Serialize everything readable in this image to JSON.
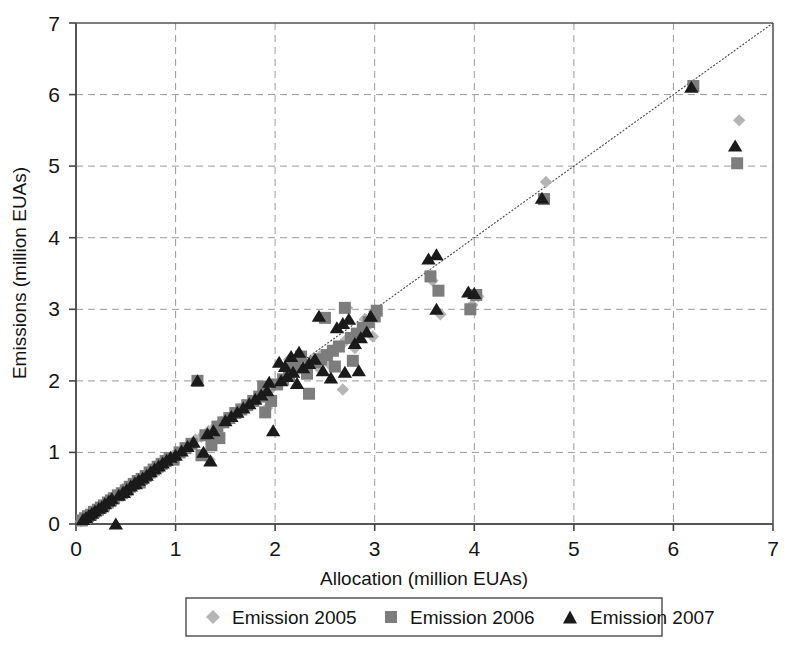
{
  "chart_data": {
    "type": "scatter",
    "title": "",
    "xlabel": "Allocation (million EUAs)",
    "ylabel": "Emissions (million EUAs)",
    "xlim": [
      0,
      7
    ],
    "ylim": [
      0,
      7
    ],
    "xticks": [
      "0",
      "1",
      "2",
      "3",
      "4",
      "5",
      "6",
      "7"
    ],
    "yticks": [
      "0",
      "1",
      "2",
      "3",
      "4",
      "5",
      "6",
      "7"
    ],
    "grid": "dashed-gray-both-axes",
    "legend_position": "below-axis-centered",
    "reference_line": {
      "label": "1:1 diagonal",
      "from": [
        0,
        0
      ],
      "to": [
        7,
        7
      ],
      "style": "thin dotted dark gray"
    },
    "legend": [
      {
        "label": "Emission 2005",
        "marker": "diamond",
        "color": "#b5b5b5"
      },
      {
        "label": "Emission 2006",
        "marker": "square",
        "color": "#7d7d7d"
      },
      {
        "label": "Emission 2007",
        "marker": "triangle",
        "color": "#1a1a1a"
      }
    ],
    "series": [
      {
        "name": "Emission 2005",
        "marker": "diamond",
        "color": "#b5b5b5",
        "points": [
          [
            0.05,
            0.04
          ],
          [
            0.08,
            0.07
          ],
          [
            0.11,
            0.1
          ],
          [
            0.14,
            0.12
          ],
          [
            0.17,
            0.16
          ],
          [
            0.2,
            0.19
          ],
          [
            0.23,
            0.21
          ],
          [
            0.26,
            0.25
          ],
          [
            0.3,
            0.28
          ],
          [
            0.33,
            0.31
          ],
          [
            0.36,
            0.34
          ],
          [
            0.4,
            0.38
          ],
          [
            0.44,
            0.41
          ],
          [
            0.48,
            0.45
          ],
          [
            0.52,
            0.5
          ],
          [
            0.56,
            0.54
          ],
          [
            0.6,
            0.57
          ],
          [
            0.64,
            0.62
          ],
          [
            0.68,
            0.66
          ],
          [
            0.72,
            0.69
          ],
          [
            0.76,
            0.74
          ],
          [
            0.8,
            0.78
          ],
          [
            0.84,
            0.82
          ],
          [
            0.88,
            0.86
          ],
          [
            0.7,
            0.62
          ],
          [
            0.75,
            0.68
          ],
          [
            0.92,
            0.9
          ],
          [
            0.97,
            0.95
          ],
          [
            1.02,
            1.0
          ],
          [
            1.08,
            1.05
          ],
          [
            1.14,
            1.1
          ],
          [
            1.2,
            1.18
          ],
          [
            1.26,
            1.22
          ],
          [
            1.33,
            1.3
          ],
          [
            1.4,
            1.36
          ],
          [
            1.46,
            1.42
          ],
          [
            1.52,
            1.48
          ],
          [
            1.58,
            1.53
          ],
          [
            1.64,
            1.6
          ],
          [
            1.7,
            1.66
          ],
          [
            1.76,
            1.72
          ],
          [
            1.83,
            1.78
          ],
          [
            1.9,
            1.85
          ],
          [
            1.97,
            1.9
          ],
          [
            2.04,
            1.97
          ],
          [
            2.1,
            2.02
          ],
          [
            2.17,
            2.1
          ],
          [
            2.24,
            2.16
          ],
          [
            2.3,
            2.22
          ],
          [
            2.38,
            2.3
          ],
          [
            2.46,
            2.36
          ],
          [
            2.54,
            2.24
          ],
          [
            2.62,
            2.48
          ],
          [
            2.7,
            2.55
          ],
          [
            2.26,
            2.18
          ],
          [
            2.72,
            2.58
          ],
          [
            2.78,
            2.62
          ],
          [
            2.86,
            2.7
          ],
          [
            2.94,
            2.78
          ],
          [
            2.66,
            2.5
          ],
          [
            2.68,
            1.88
          ],
          [
            2.8,
            2.46
          ],
          [
            2.72,
            3.02
          ],
          [
            2.9,
            2.86
          ],
          [
            3.58,
            3.4
          ],
          [
            3.66,
            2.93
          ],
          [
            3.98,
            3.06
          ],
          [
            4.04,
            3.18
          ],
          [
            4.72,
            4.78
          ],
          [
            6.66,
            5.64
          ],
          [
            1.34,
            0.9
          ],
          [
            1.92,
            1.62
          ],
          [
            2.14,
            2.3
          ],
          [
            2.44,
            2.18
          ],
          [
            2.56,
            2.42
          ],
          [
            2.98,
            2.62
          ],
          [
            0.45,
            0.42
          ],
          [
            0.58,
            0.52
          ]
        ]
      },
      {
        "name": "Emission 2006",
        "marker": "square",
        "color": "#7d7d7d",
        "points": [
          [
            0.06,
            0.05
          ],
          [
            0.09,
            0.08
          ],
          [
            0.12,
            0.11
          ],
          [
            0.15,
            0.13
          ],
          [
            0.18,
            0.17
          ],
          [
            0.22,
            0.2
          ],
          [
            0.25,
            0.23
          ],
          [
            0.28,
            0.26
          ],
          [
            0.32,
            0.3
          ],
          [
            0.35,
            0.33
          ],
          [
            0.38,
            0.36
          ],
          [
            0.42,
            0.4
          ],
          [
            0.46,
            0.43
          ],
          [
            0.5,
            0.47
          ],
          [
            0.54,
            0.52
          ],
          [
            0.58,
            0.56
          ],
          [
            0.62,
            0.6
          ],
          [
            0.66,
            0.63
          ],
          [
            0.7,
            0.67
          ],
          [
            0.74,
            0.72
          ],
          [
            0.78,
            0.76
          ],
          [
            0.82,
            0.8
          ],
          [
            0.86,
            0.84
          ],
          [
            0.9,
            0.88
          ],
          [
            0.94,
            0.92
          ],
          [
            0.98,
            0.9
          ],
          [
            1.04,
            1.0
          ],
          [
            1.1,
            1.06
          ],
          [
            1.16,
            1.12
          ],
          [
            1.22,
            2.0
          ],
          [
            1.3,
            1.24
          ],
          [
            1.36,
            1.1
          ],
          [
            1.42,
            1.36
          ],
          [
            1.48,
            1.42
          ],
          [
            1.54,
            1.48
          ],
          [
            1.6,
            1.55
          ],
          [
            1.66,
            1.6
          ],
          [
            1.72,
            1.66
          ],
          [
            1.78,
            1.72
          ],
          [
            1.84,
            1.78
          ],
          [
            1.9,
            1.56
          ],
          [
            1.96,
            1.72
          ],
          [
            2.02,
            1.95
          ],
          [
            2.08,
            2.02
          ],
          [
            2.14,
            2.08
          ],
          [
            2.2,
            2.28
          ],
          [
            2.26,
            2.34
          ],
          [
            2.32,
            2.1
          ],
          [
            2.4,
            2.26
          ],
          [
            2.46,
            2.3
          ],
          [
            2.52,
            2.36
          ],
          [
            2.58,
            2.42
          ],
          [
            2.64,
            2.48
          ],
          [
            2.7,
            3.02
          ],
          [
            2.76,
            2.6
          ],
          [
            2.82,
            2.66
          ],
          [
            2.88,
            2.74
          ],
          [
            2.94,
            2.82
          ],
          [
            3.0,
            2.9
          ],
          [
            2.6,
            2.2
          ],
          [
            3.56,
            3.46
          ],
          [
            3.64,
            3.26
          ],
          [
            3.96,
            3.0
          ],
          [
            4.02,
            3.2
          ],
          [
            4.7,
            4.54
          ],
          [
            6.2,
            6.12
          ],
          [
            6.64,
            5.04
          ],
          [
            1.26,
            0.96
          ],
          [
            1.88,
            1.92
          ],
          [
            2.18,
            2.2
          ],
          [
            2.34,
            1.82
          ],
          [
            2.78,
            2.28
          ],
          [
            1.44,
            1.2
          ],
          [
            0.52,
            0.48
          ],
          [
            0.64,
            0.58
          ],
          [
            2.5,
            2.88
          ],
          [
            3.02,
            2.98
          ]
        ]
      },
      {
        "name": "Emission 2007",
        "marker": "triangle",
        "color": "#1a1a1a",
        "points": [
          [
            0.07,
            0.06
          ],
          [
            0.1,
            0.09
          ],
          [
            0.13,
            0.12
          ],
          [
            0.16,
            0.15
          ],
          [
            0.19,
            0.18
          ],
          [
            0.23,
            0.22
          ],
          [
            0.26,
            0.24
          ],
          [
            0.29,
            0.28
          ],
          [
            0.33,
            0.32
          ],
          [
            0.36,
            0.35
          ],
          [
            0.4,
            0.0
          ],
          [
            0.43,
            0.4
          ],
          [
            0.47,
            0.44
          ],
          [
            0.51,
            0.48
          ],
          [
            0.55,
            0.53
          ],
          [
            0.59,
            0.57
          ],
          [
            0.63,
            0.61
          ],
          [
            0.67,
            0.64
          ],
          [
            0.71,
            0.68
          ],
          [
            0.75,
            0.73
          ],
          [
            0.79,
            0.77
          ],
          [
            0.83,
            0.81
          ],
          [
            0.87,
            0.85
          ],
          [
            0.91,
            0.89
          ],
          [
            0.95,
            0.93
          ],
          [
            1.0,
            0.96
          ],
          [
            1.06,
            1.02
          ],
          [
            1.12,
            1.08
          ],
          [
            1.18,
            1.14
          ],
          [
            1.22,
            2.0
          ],
          [
            1.32,
            1.26
          ],
          [
            1.38,
            1.3
          ],
          [
            1.35,
            0.88
          ],
          [
            1.5,
            1.44
          ],
          [
            1.56,
            1.5
          ],
          [
            1.62,
            1.56
          ],
          [
            1.68,
            1.62
          ],
          [
            1.74,
            1.68
          ],
          [
            1.8,
            1.74
          ],
          [
            1.86,
            1.8
          ],
          [
            1.92,
            1.86
          ],
          [
            1.98,
            1.3
          ],
          [
            2.06,
            2.0
          ],
          [
            2.12,
            2.06
          ],
          [
            2.18,
            2.12
          ],
          [
            2.16,
            2.34
          ],
          [
            2.28,
            2.18
          ],
          [
            2.22,
            1.96
          ],
          [
            2.34,
            2.24
          ],
          [
            2.4,
            2.3
          ],
          [
            2.48,
            2.14
          ],
          [
            2.56,
            2.04
          ],
          [
            2.62,
            2.74
          ],
          [
            2.68,
            2.8
          ],
          [
            2.74,
            2.86
          ],
          [
            2.8,
            2.52
          ],
          [
            2.86,
            2.6
          ],
          [
            2.92,
            2.68
          ],
          [
            2.96,
            2.9
          ],
          [
            2.7,
            2.12
          ],
          [
            3.54,
            3.7
          ],
          [
            3.62,
            3.76
          ],
          [
            3.94,
            3.24
          ],
          [
            4.0,
            3.22
          ],
          [
            4.68,
            4.55
          ],
          [
            6.18,
            6.1
          ],
          [
            6.62,
            5.28
          ],
          [
            1.28,
            1.0
          ],
          [
            1.94,
            1.98
          ],
          [
            2.1,
            2.2
          ],
          [
            2.24,
            2.4
          ],
          [
            2.84,
            2.14
          ],
          [
            3.62,
            3.0
          ],
          [
            0.48,
            0.44
          ],
          [
            0.6,
            0.56
          ],
          [
            2.04,
            2.26
          ],
          [
            2.44,
            2.9
          ]
        ]
      }
    ]
  },
  "axis": {
    "x_title": "Allocation (million EUAs)",
    "y_title": "Emissions (million EUAs)",
    "x_tick_0": "0",
    "x_tick_1": "1",
    "x_tick_2": "2",
    "x_tick_3": "3",
    "x_tick_4": "4",
    "x_tick_5": "5",
    "x_tick_6": "6",
    "x_tick_7": "7",
    "y_tick_0": "0",
    "y_tick_1": "1",
    "y_tick_2": "2",
    "y_tick_3": "3",
    "y_tick_4": "4",
    "y_tick_5": "5",
    "y_tick_6": "6",
    "y_tick_7": "7"
  },
  "legend": {
    "item_0_label": "Emission 2005",
    "item_1_label": "Emission 2006",
    "item_2_label": "Emission 2007"
  },
  "colors": {
    "series_2005": "#b5b5b5",
    "series_2006": "#7d7d7d",
    "series_2007": "#1a1a1a",
    "grid": "#9a9a9a",
    "axis": "#555555",
    "refline": "#4a4a4a"
  }
}
